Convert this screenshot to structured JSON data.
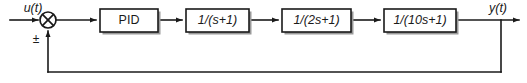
{
  "diagram": {
    "type": "block-diagram",
    "background_color": "#ffffff",
    "line_color": "#1a1a1a",
    "shadow_color": "#9a9a9a",
    "input_signal": {
      "label": "u(t)",
      "name": "input-signal-label"
    },
    "output_signal": {
      "label": "y(t)",
      "name": "output-signal-label"
    },
    "summing_junction": {
      "name": "summing-junction",
      "glyph": "circle-with-cross",
      "sign_label": "±",
      "cx": 48,
      "cy": 20,
      "r": 8
    },
    "blocks": [
      {
        "name": "pid-block",
        "label": "PID",
        "italic": false,
        "x": 100,
        "y": 9,
        "w": 58,
        "h": 23
      },
      {
        "name": "plant-block-1",
        "label": "1/(s+1)",
        "italic": true,
        "x": 186,
        "y": 9,
        "w": 63,
        "h": 23
      },
      {
        "name": "plant-block-2",
        "label": "1/(2s+1)",
        "italic": true,
        "x": 282,
        "y": 9,
        "w": 69,
        "h": 23
      },
      {
        "name": "plant-block-3",
        "label": "1/(10s+1)",
        "italic": true,
        "x": 384,
        "y": 9,
        "w": 72,
        "h": 23
      }
    ],
    "feedback_path": {
      "name": "feedback-path",
      "description": "unity feedback from output to summing junction",
      "tap_x": 501,
      "bottom_y": 72
    }
  }
}
